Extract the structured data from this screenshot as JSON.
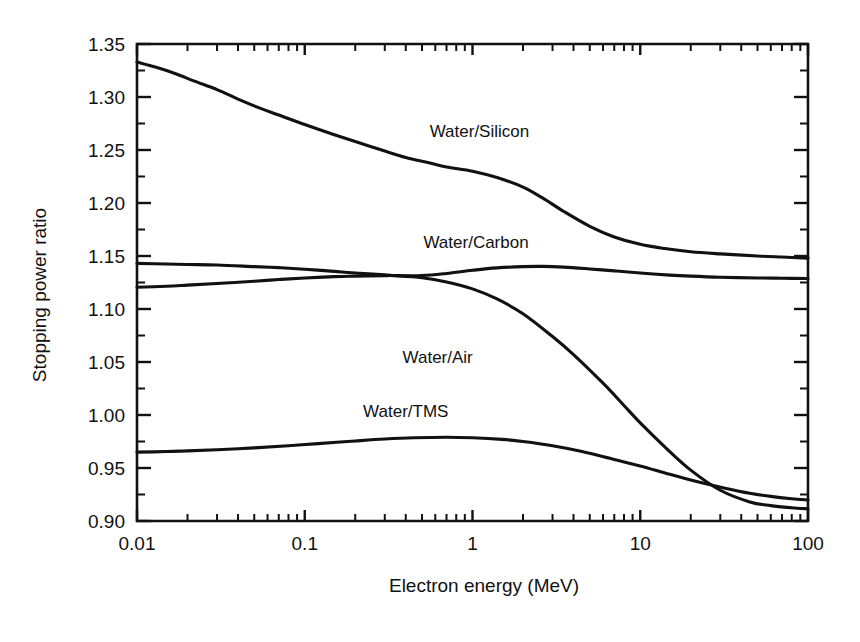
{
  "figure": {
    "background_color": "#ffffff",
    "ink_color": "#111111"
  },
  "chart_data": {
    "type": "line",
    "title": "",
    "xlabel": "Electron energy (MeV)",
    "ylabel": "Stopping power ratio",
    "xscale": "log",
    "yscale": "linear",
    "xlim": [
      0.01,
      100
    ],
    "ylim": [
      0.9,
      1.35
    ],
    "grid": false,
    "legend_position": "inline-labels",
    "x_tick_labels": [
      "0.01",
      "0.1",
      "1",
      "10",
      "100"
    ],
    "x_tick_values": [
      0.01,
      0.1,
      1,
      10,
      100
    ],
    "y_tick_labels": [
      "0.90",
      "0.95",
      "1.00",
      "1.05",
      "1.10",
      "1.15",
      "1.20",
      "1.25",
      "1.30",
      "1.35"
    ],
    "y_tick_values": [
      0.9,
      0.95,
      1.0,
      1.05,
      1.1,
      1.15,
      1.2,
      1.25,
      1.3,
      1.35
    ],
    "y_minor_tick_values": [
      0.925,
      0.975,
      1.025,
      1.075,
      1.125,
      1.175,
      1.225,
      1.275,
      1.325
    ],
    "series": [
      {
        "name": "Water/Silicon",
        "label": "Water/Silicon",
        "label_x": 1.1,
        "label_y": 1.262,
        "x": [
          0.01,
          0.013,
          0.017,
          0.022,
          0.03,
          0.04,
          0.055,
          0.07,
          0.1,
          0.14,
          0.2,
          0.3,
          0.4,
          0.55,
          0.7,
          1.0,
          1.4,
          2.0,
          2.6,
          3.5,
          5.0,
          7.0,
          10.0,
          14.0,
          20.0,
          30.0,
          50.0,
          70.0,
          100.0
        ],
        "y": [
          1.333,
          1.328,
          1.322,
          1.315,
          1.307,
          1.298,
          1.289,
          1.283,
          1.274,
          1.266,
          1.258,
          1.249,
          1.243,
          1.238,
          1.234,
          1.23,
          1.224,
          1.215,
          1.205,
          1.192,
          1.178,
          1.168,
          1.161,
          1.157,
          1.154,
          1.152,
          1.15,
          1.149,
          1.148
        ]
      },
      {
        "name": "Water/Carbon",
        "label": "Water/Carbon",
        "label_x": 1.05,
        "label_y": 1.158,
        "x": [
          0.01,
          0.015,
          0.02,
          0.03,
          0.05,
          0.07,
          0.1,
          0.15,
          0.2,
          0.3,
          0.35,
          0.5,
          0.7,
          1.0,
          1.4,
          2.0,
          2.6,
          3.5,
          5.0,
          7.0,
          10.0,
          15.0,
          20.0,
          30.0,
          50.0,
          70.0,
          100.0
        ],
        "y": [
          1.143,
          1.1425,
          1.142,
          1.1415,
          1.14,
          1.139,
          1.1375,
          1.1355,
          1.134,
          1.1322,
          1.1315,
          1.1315,
          1.1335,
          1.1365,
          1.1388,
          1.14,
          1.1402,
          1.1395,
          1.1378,
          1.136,
          1.134,
          1.132,
          1.131,
          1.13,
          1.1293,
          1.129,
          1.1288
        ]
      },
      {
        "name": "Water/Air",
        "label": "Water/Air",
        "label_x": 0.62,
        "label_y": 1.049,
        "x": [
          0.01,
          0.015,
          0.02,
          0.03,
          0.05,
          0.07,
          0.1,
          0.15,
          0.2,
          0.3,
          0.35,
          0.5,
          0.7,
          1.0,
          1.4,
          2.0,
          3.0,
          4.0,
          6.0,
          8.0,
          10.0,
          14.0,
          20.0,
          30.0,
          45.0,
          60.0,
          80.0,
          100.0
        ],
        "y": [
          1.1205,
          1.1215,
          1.1225,
          1.124,
          1.1262,
          1.1278,
          1.1292,
          1.1305,
          1.131,
          1.1315,
          1.1313,
          1.1295,
          1.1255,
          1.119,
          1.1095,
          1.0955,
          1.074,
          1.057,
          1.03,
          1.009,
          0.9925,
          0.97,
          0.948,
          0.929,
          0.918,
          0.9145,
          0.9125,
          0.9115
        ]
      },
      {
        "name": "Water/TMS",
        "label": "Water/TMS",
        "label_x": 0.4,
        "label_y": 0.998,
        "x": [
          0.01,
          0.015,
          0.02,
          0.03,
          0.05,
          0.08,
          0.12,
          0.2,
          0.3,
          0.45,
          0.7,
          1.0,
          1.5,
          2.0,
          3.0,
          4.5,
          7.0,
          10.0,
          15.0,
          22.0,
          32.0,
          45.0,
          60.0,
          80.0,
          100.0
        ],
        "y": [
          0.965,
          0.9655,
          0.9662,
          0.9672,
          0.969,
          0.971,
          0.973,
          0.9755,
          0.9773,
          0.9785,
          0.979,
          0.9785,
          0.977,
          0.975,
          0.971,
          0.9655,
          0.958,
          0.952,
          0.944,
          0.937,
          0.931,
          0.9262,
          0.9232,
          0.921,
          0.9198
        ]
      }
    ]
  }
}
